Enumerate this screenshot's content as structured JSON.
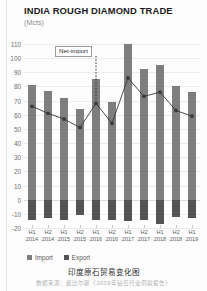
{
  "header": {
    "title": "INDIA ROUGH DIAMOND TRADE",
    "subtitle": "(Mcts)"
  },
  "legend": {
    "import_label": "Import",
    "export_label": "Export"
  },
  "caption": {
    "text": "印度原石贸易变化图",
    "source": "数据来源：戴比尔斯《2019年钻石行业洞察报告》"
  },
  "colors": {
    "import_bar": "#7e7e7e",
    "export_bar": "#545454",
    "line": "#3a3a3a",
    "grid": "#ececec"
  },
  "chart_data": {
    "type": "bar",
    "title": "INDIA ROUGH DIAMOND TRADE",
    "subtitle": "(Mcts)",
    "xlabel": "",
    "ylabel": "(Mcts)",
    "ylim": [
      -20,
      110
    ],
    "ytick_step": 10,
    "yticks": [
      110,
      100,
      90,
      80,
      70,
      60,
      50,
      40,
      30,
      20,
      10,
      0,
      -10,
      -20
    ],
    "grid": true,
    "legend_position": "bottom-left",
    "categories": [
      "H1 2014",
      "H2 2014",
      "H1 2015",
      "H2 2015",
      "H1 2016",
      "H2 2016",
      "H1 2017",
      "H2 2017",
      "H1 2018",
      "H2 2018",
      "H1 2019"
    ],
    "category_lines": [
      [
        "H1",
        "2014"
      ],
      [
        "H2",
        "2014"
      ],
      [
        "H1",
        "2015"
      ],
      [
        "H2",
        "2015"
      ],
      [
        "H1",
        "2016"
      ],
      [
        "H2",
        "2016"
      ],
      [
        "H1",
        "2017"
      ],
      [
        "H2",
        "2017"
      ],
      [
        "H1",
        "2018"
      ],
      [
        "H2",
        "2018"
      ],
      [
        "H1",
        "2019"
      ]
    ],
    "series": [
      {
        "name": "Import",
        "type": "bar",
        "values": [
          81,
          77,
          72,
          64,
          85,
          69,
          110,
          92,
          95,
          80,
          76
        ]
      },
      {
        "name": "Export",
        "type": "bar",
        "values": [
          -14,
          -13,
          -14,
          -11,
          -14,
          -14,
          -15,
          -14,
          -17,
          -12,
          -13
        ]
      },
      {
        "name": "Net-import",
        "type": "line",
        "values": [
          66,
          61,
          57,
          51,
          68,
          54,
          86,
          73,
          76,
          63,
          59
        ]
      }
    ],
    "annotations": [
      {
        "text": "Net-import",
        "target_category": "H1 2016",
        "target_value": 68
      }
    ]
  }
}
